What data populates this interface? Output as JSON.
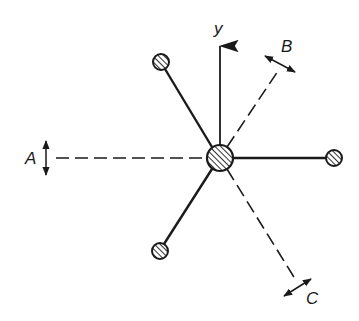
{
  "diagram": {
    "type": "molecular vibration / vector diagram",
    "colors": {
      "ink": "#1a1a1a",
      "background": "#ffffff"
    },
    "axis": {
      "label": "y"
    },
    "directions": [
      {
        "id": "A",
        "label": "A",
        "style": "dashed",
        "double_arrow": "vertical"
      },
      {
        "id": "B",
        "label": "B",
        "style": "dashed",
        "double_arrow": "perpendicular"
      },
      {
        "id": "C",
        "label": "C",
        "style": "dashed",
        "double_arrow": "perpendicular"
      }
    ],
    "atoms": [
      {
        "id": "center",
        "role": "central atom",
        "fill": "hatched"
      },
      {
        "id": "right",
        "role": "ligand",
        "fill": "hatched"
      },
      {
        "id": "upper-left",
        "role": "ligand",
        "fill": "hatched"
      },
      {
        "id": "lower-left",
        "role": "ligand",
        "fill": "hatched"
      }
    ]
  }
}
